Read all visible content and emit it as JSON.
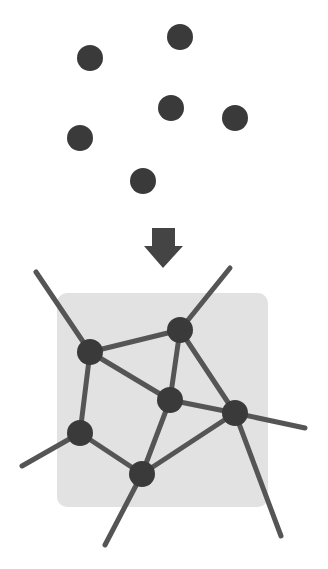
{
  "diagram": {
    "title": "",
    "colors": {
      "background": "#ffffff",
      "node": "#3a3a3a",
      "edge": "#555555",
      "region": "#e2e2e2",
      "arrow": "#444444"
    },
    "scattered_points": [
      {
        "id": "p1",
        "x": 90,
        "y": 58
      },
      {
        "id": "p2",
        "x": 180,
        "y": 37
      },
      {
        "id": "p3",
        "x": 171,
        "y": 108
      },
      {
        "id": "p4",
        "x": 235,
        "y": 118
      },
      {
        "id": "p5",
        "x": 80,
        "y": 138
      },
      {
        "id": "p6",
        "x": 143,
        "y": 181
      }
    ],
    "arrow": {
      "direction": "down",
      "x": 163,
      "y_top": 228,
      "y_tip": 268
    },
    "region": {
      "x": 57,
      "y": 293,
      "width": 211,
      "height": 214
    },
    "network_nodes": [
      {
        "id": "A",
        "x": 90,
        "y": 352
      },
      {
        "id": "B",
        "x": 180,
        "y": 330
      },
      {
        "id": "C",
        "x": 170,
        "y": 400
      },
      {
        "id": "D",
        "x": 235,
        "y": 413
      },
      {
        "id": "E",
        "x": 80,
        "y": 433
      },
      {
        "id": "F",
        "x": 142,
        "y": 474
      }
    ],
    "network_edges": [
      {
        "from": "A",
        "to": "B"
      },
      {
        "from": "A",
        "to": "C"
      },
      {
        "from": "A",
        "to": "E"
      },
      {
        "from": "B",
        "to": "C"
      },
      {
        "from": "B",
        "to": "D"
      },
      {
        "from": "C",
        "to": "D"
      },
      {
        "from": "C",
        "to": "F"
      },
      {
        "from": "D",
        "to": "F"
      },
      {
        "from": "E",
        "to": "F"
      }
    ],
    "outer_edges": [
      {
        "from": "A",
        "x2": 36,
        "y2": 272
      },
      {
        "from": "B",
        "x2": 230,
        "y2": 268
      },
      {
        "from": "D",
        "x2": 305,
        "y2": 428
      },
      {
        "from": "D",
        "x2": 281,
        "y2": 536
      },
      {
        "from": "E",
        "x2": 22,
        "y2": 466
      },
      {
        "from": "F",
        "x2": 105,
        "y2": 545
      }
    ],
    "node_radius": 13
  }
}
